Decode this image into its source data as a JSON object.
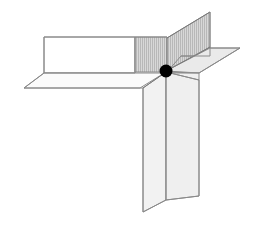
{
  "figure": {
    "background_color": "#ffffff",
    "canvas": {
      "width": 255,
      "height": 228
    },
    "colors": {
      "outline": "#8a8a8a",
      "outline_dark": "#6f6f6f",
      "white_face": "#ffffff",
      "light_face": "#f2f2f2",
      "pale_face": "#ededed",
      "mid_face": "#e0e0e0",
      "hatch_face": "#d6d6d6",
      "hatch_stroke": "#b4b4b4",
      "hatch_stroke_dark": "#9a9a9a",
      "marker": "#000000"
    },
    "marker_point": {
      "name": "intersection-point",
      "label": "",
      "x": 166,
      "y": 71,
      "radius": 6.5,
      "color": "#000000"
    },
    "planes": [
      {
        "name": "upper-left-white-panel",
        "fill": "#ffffff",
        "stroke": "#8a8a8a",
        "hatched": false,
        "points": "44,37 135,37 135,73 44,73"
      },
      {
        "name": "upper-left-hatched-panel",
        "fill": "#d6d6d6",
        "stroke": "#8a8a8a",
        "hatched": true,
        "points": "135,37 167,37 167,72 135,72"
      },
      {
        "name": "lower-left-horizontal-plane",
        "fill": "#fbfbfb",
        "stroke": "#8a8a8a",
        "hatched": false,
        "points": "44,73 167,73 166,72 140,88 24,88"
      },
      {
        "name": "upper-vertical-tall-plane",
        "fill": "#d9d9d9",
        "stroke": "#8a8a8a",
        "hatched": true,
        "points": "167,38 210,12 210,48 167,72"
      },
      {
        "name": "upper-right-hatched-wing",
        "fill": "#d4d4d4",
        "stroke": "#8a8a8a",
        "hatched": true,
        "points": "167,72 210,47 210,56 181,56"
      },
      {
        "name": "right-horizontal-plane",
        "fill": "#eaeaea",
        "stroke": "#8a8a8a",
        "hatched": false,
        "points": "166,71 210,48 240,48 199,73"
      },
      {
        "name": "right-horizontal-plane-lower",
        "fill": "#f0f0f0",
        "stroke": "#8a8a8a",
        "hatched": false,
        "points": "166,72 199,73 199,80 166,80"
      },
      {
        "name": "lower-front-vertical-plane",
        "fill": "#f2f2f2",
        "stroke": "#8a8a8a",
        "hatched": false,
        "points": "166,72 143,88 143,212 166,200"
      },
      {
        "name": "lower-back-vertical-plane",
        "fill": "#efefef",
        "stroke": "#8a8a8a",
        "hatched": false,
        "points": "166,72 199,80 199,196 166,200"
      }
    ],
    "edges": [
      {
        "name": "left-panel-top-edge",
        "points": "44,37 135,37",
        "stroke": "#8a8a8a",
        "width": 1
      },
      {
        "name": "left-panel-left-edge",
        "points": "44,37 44,73",
        "stroke": "#8a8a8a",
        "width": 1
      },
      {
        "name": "left-panel-bottom-edge",
        "points": "44,73 135,73",
        "stroke": "#8a8a8a",
        "width": 1
      },
      {
        "name": "hatch-panel-top-edge",
        "points": "135,37 167,37",
        "stroke": "#8a8a8a",
        "width": 1
      },
      {
        "name": "hatch-panel-divider",
        "points": "135,37 135,73",
        "stroke": "#8a8a8a",
        "width": 1
      },
      {
        "name": "horizontal-plane-left-edge",
        "points": "44,73 24,88",
        "stroke": "#8a8a8a",
        "width": 1
      },
      {
        "name": "horizontal-plane-front-edge",
        "points": "24,88 143,88",
        "stroke": "#8a8a8a",
        "width": 1
      },
      {
        "name": "tall-plane-left-edge",
        "points": "167,38 167,72",
        "stroke": "#8a8a8a",
        "width": 1
      },
      {
        "name": "tall-plane-top-edge",
        "points": "167,38 210,12",
        "stroke": "#7a7a7a",
        "width": 1
      },
      {
        "name": "tall-plane-right-edge",
        "points": "210,12 210,56",
        "stroke": "#8a8a8a",
        "width": 1
      },
      {
        "name": "tall-plane-diagonal-edge",
        "points": "166,71 210,47",
        "stroke": "#7a7a7a",
        "width": 1
      },
      {
        "name": "right-plane-top-edge",
        "points": "210,48 240,48",
        "stroke": "#8a8a8a",
        "width": 1
      },
      {
        "name": "right-plane-outer-edge",
        "points": "240,48 199,73",
        "stroke": "#8a8a8a",
        "width": 1
      },
      {
        "name": "right-plane-inner-edge",
        "points": "199,73 166,73",
        "stroke": "#8a8a8a",
        "width": 1
      },
      {
        "name": "right-wing-lower-edge",
        "points": "181,56 210,56",
        "stroke": "#8a8a8a",
        "width": 1
      },
      {
        "name": "front-plane-fold-edge",
        "points": "166,72 166,200",
        "stroke": "#8a8a8a",
        "width": 1
      },
      {
        "name": "front-plane-slant-edge",
        "points": "166,72 143,88",
        "stroke": "#7a7a7a",
        "width": 1
      },
      {
        "name": "front-plane-left-edge",
        "points": "143,88 143,212",
        "stroke": "#8a8a8a",
        "width": 1
      },
      {
        "name": "front-plane-bottom-edge",
        "points": "143,212 166,200",
        "stroke": "#8a8a8a",
        "width": 1
      },
      {
        "name": "back-plane-right-edge",
        "points": "199,80 199,196",
        "stroke": "#8a8a8a",
        "width": 1
      },
      {
        "name": "back-plane-bottom-edge",
        "points": "166,200 199,196",
        "stroke": "#8a8a8a",
        "width": 1
      },
      {
        "name": "back-plane-top-slant",
        "points": "166,72 199,80",
        "stroke": "#8a8a8a",
        "width": 1
      }
    ]
  }
}
